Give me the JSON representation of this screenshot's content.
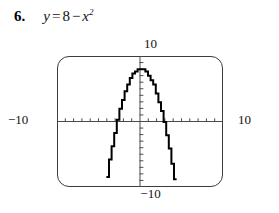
{
  "problem": {
    "number": "6.",
    "equation_plain": "y = 8 - x^2",
    "lhs": "y",
    "equals": "=",
    "constant": "8",
    "minus": "−",
    "variable": "x",
    "exponent": "2"
  },
  "graph": {
    "window_labels": {
      "top": "10",
      "bottom": "−10",
      "left": "−10",
      "right": "10"
    },
    "frame_color": "#3c3c3c",
    "curve_color": "#000000",
    "axis_color": "#4a4a4a"
  },
  "chart_data": {
    "type": "line",
    "xlabel": "x",
    "ylabel": "y",
    "xlim": [
      -10,
      10
    ],
    "ylim": [
      -10,
      10
    ],
    "grid": false,
    "legend": null,
    "x_tick_step": 1,
    "y_tick_step": 1,
    "x_tick_labels": [
      "-10",
      "10"
    ],
    "y_tick_labels": [
      "-10",
      "10"
    ],
    "series": [
      {
        "name": "y = 8 - x^2",
        "equation": "y = 8 - x^2",
        "vertex": [
          0,
          8
        ],
        "x_intercepts": [
          -2.828,
          2.828
        ],
        "y_intercept": 8,
        "x": [
          -4.243,
          -4.0,
          -3.75,
          -3.5,
          -3.25,
          -3.0,
          -2.75,
          -2.5,
          -2.25,
          -2.0,
          -1.75,
          -1.5,
          -1.25,
          -1.0,
          -0.75,
          -0.5,
          -0.25,
          0,
          0.25,
          0.5,
          0.75,
          1.0,
          1.25,
          1.5,
          1.75,
          2.0,
          2.25,
          2.5,
          2.75,
          3.0,
          3.25,
          3.5,
          3.75,
          4.0,
          4.243
        ],
        "y": [
          -10.0,
          -8.0,
          -6.06,
          -4.25,
          -2.56,
          -1.0,
          0.44,
          1.75,
          2.94,
          4.0,
          4.94,
          5.75,
          6.44,
          7.0,
          7.44,
          7.75,
          7.94,
          8.0,
          7.94,
          7.75,
          7.44,
          7.0,
          6.44,
          5.75,
          4.94,
          4.0,
          2.94,
          1.75,
          0.44,
          -1.0,
          -2.56,
          -4.25,
          -6.06,
          -8.0,
          -10.0
        ]
      }
    ]
  }
}
